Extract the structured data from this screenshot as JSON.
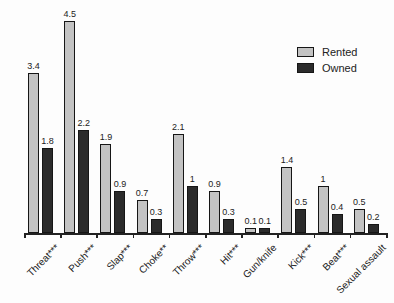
{
  "chart_data": {
    "type": "bar",
    "categories": [
      "Threat***",
      "Push***",
      "Slap***",
      "Choke**",
      "Throw***",
      "Hit***",
      "Gun/knife",
      "Kick***",
      "Beat***",
      "Sexual assault"
    ],
    "series": [
      {
        "name": "Rented",
        "color": "#c3c3c3",
        "values": [
          3.4,
          4.5,
          1.9,
          0.7,
          2.1,
          0.9,
          0.1,
          1.4,
          1,
          0.5
        ],
        "value_labels": [
          "3.4",
          "4.5",
          "1.9",
          "0.7",
          "2.1",
          "0.9",
          "0.1",
          "1.4",
          "1",
          "0.5"
        ]
      },
      {
        "name": "Owned",
        "color": "#2b2b2b",
        "values": [
          1.8,
          2.2,
          0.9,
          0.3,
          1,
          0.3,
          0.1,
          0.5,
          0.4,
          0.2
        ],
        "value_labels": [
          "1.8",
          "2.2",
          "0.9",
          "0.3",
          "1",
          "0.3",
          "0.1",
          "0.5",
          "0.4",
          "0.2"
        ]
      }
    ],
    "title": "",
    "xlabel": "",
    "ylabel": "",
    "ylim": [
      0,
      4.8
    ],
    "grid": false,
    "legend_position": "upper right",
    "y_axis_visible": false
  }
}
